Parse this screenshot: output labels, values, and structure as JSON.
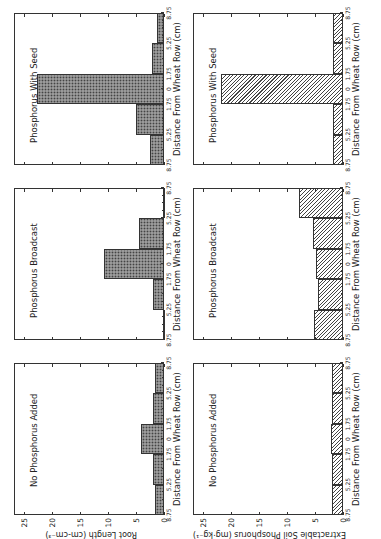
{
  "chart_data": [
    {
      "type": "bar",
      "panel": "top-left",
      "title": "No Phosphorus Added",
      "xlabel": "Distance From Wheat Row (cm)",
      "ylabel": "Root Length (cm-cm^-3)",
      "ylim": [
        0,
        27
      ],
      "yticks": [
        0,
        5,
        10,
        15,
        20,
        25
      ],
      "categories": [
        "8.75-5.25",
        "5.25-1.75",
        "1.75-0-1.75",
        "1.75-5.25",
        "5.25-8.75"
      ],
      "values": [
        1.6,
        2.0,
        4.1,
        2.0,
        1.6
      ],
      "fill": "dotted"
    },
    {
      "type": "bar",
      "panel": "top-middle",
      "title": "Phosphorus Broadcast",
      "xlabel": "Distance From Wheat Row (cm)",
      "ylabel": "",
      "ylim": [
        0,
        27
      ],
      "categories": [
        "8.75-5.25",
        "5.25-1.75",
        "1.75-0-1.75",
        "1.75-5.25",
        "5.25-8.75"
      ],
      "values": [
        0.2,
        4.5,
        10.7,
        2.0,
        0.2
      ],
      "fill": "dotted"
    },
    {
      "type": "bar",
      "panel": "top-right",
      "title": "Phosphorus With Seed",
      "xlabel": "Distance From Wheat Row (cm)",
      "ylabel": "",
      "ylim": [
        0,
        27
      ],
      "categories": [
        "8.75-5.25",
        "5.25-1.75",
        "1.75-0-1.75",
        "1.75-5.25",
        "5.25-8.75"
      ],
      "values": [
        1.3,
        2.1,
        22.7,
        5.0,
        2.5
      ],
      "fill": "dotted"
    },
    {
      "type": "bar",
      "panel": "bottom-left",
      "title": "No Phosphorus Added",
      "xlabel": "Distance From Wheat Row (cm)",
      "ylabel": "Extractable Soil Phosphorus (mg-kg^-1)",
      "ylim": [
        0,
        27
      ],
      "yticks": [
        0,
        5,
        10,
        15,
        20,
        25
      ],
      "categories": [
        "8.75-5.25",
        "5.25-1.75",
        "1.75-0-1.75",
        "1.75-5.25",
        "5.25-8.75"
      ],
      "values": [
        1.9,
        2.0,
        2.1,
        2.0,
        1.9
      ],
      "fill": "hatched"
    },
    {
      "type": "bar",
      "panel": "bottom-middle",
      "title": "Phosphorus Broadcast",
      "xlabel": "Distance From Wheat Row (cm)",
      "ylabel": "",
      "ylim": [
        0,
        27
      ],
      "categories": [
        "8.75-5.25",
        "5.25-1.75",
        "1.75-0-1.75",
        "1.75-5.25",
        "5.25-8.75"
      ],
      "values": [
        7.8,
        5.4,
        4.9,
        4.4,
        5.1
      ],
      "fill": "hatched"
    },
    {
      "type": "bar",
      "panel": "bottom-right",
      "title": "Phosphorus With Seed",
      "xlabel": "Distance From Wheat Row (cm)",
      "ylabel": "",
      "ylim": [
        0,
        27
      ],
      "categories": [
        "8.75-5.25",
        "5.25-1.75",
        "1.75-0-1.75",
        "1.75-5.25",
        "5.25-8.75"
      ],
      "values": [
        1.8,
        1.8,
        21.8,
        1.8,
        1.8
      ],
      "fill": "hatched"
    }
  ],
  "axis": {
    "xtick_labels": [
      "8.75",
      "5.25",
      "1.75",
      "0",
      "1.75",
      "5.25",
      "8.75"
    ],
    "ytick_labels": [
      "0",
      "5",
      "10",
      "15",
      "20",
      "25"
    ]
  },
  "labels": {
    "xlabel": "Distance From Wheat Row (cm)",
    "ylabel_top": "Root Length (cm-cm⁻³)",
    "ylabel_bottom": "Extractable Soil Phosphorus (mg·kg⁻¹)"
  }
}
